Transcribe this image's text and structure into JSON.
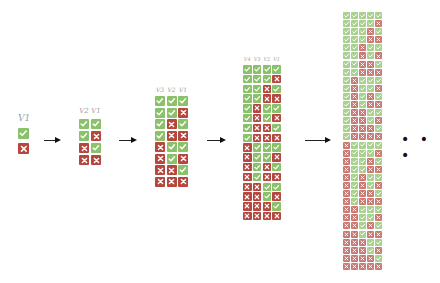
{
  "diagram": {
    "colors": {
      "true": "#8bc16a",
      "false": "#b5473f",
      "mark": "#ffffff",
      "arrow": "#111111",
      "label": "#9aa0a6"
    },
    "icons": {
      "true": "check-icon",
      "false": "cross-icon"
    },
    "ellipsis": "• • •",
    "groups": [
      {
        "variables": [
          "V1"
        ],
        "rows": 2
      },
      {
        "variables": [
          "V2",
          "V1"
        ],
        "rows": 4
      },
      {
        "variables": [
          "V3",
          "V2",
          "V1"
        ],
        "rows": 8
      },
      {
        "variables": [
          "V4",
          "V3",
          "V2",
          "V1"
        ],
        "rows": 16
      },
      {
        "variables": [
          "V5",
          "V4",
          "V3",
          "V2",
          "V1"
        ],
        "rows": 32,
        "labels_visible": false
      }
    ]
  }
}
